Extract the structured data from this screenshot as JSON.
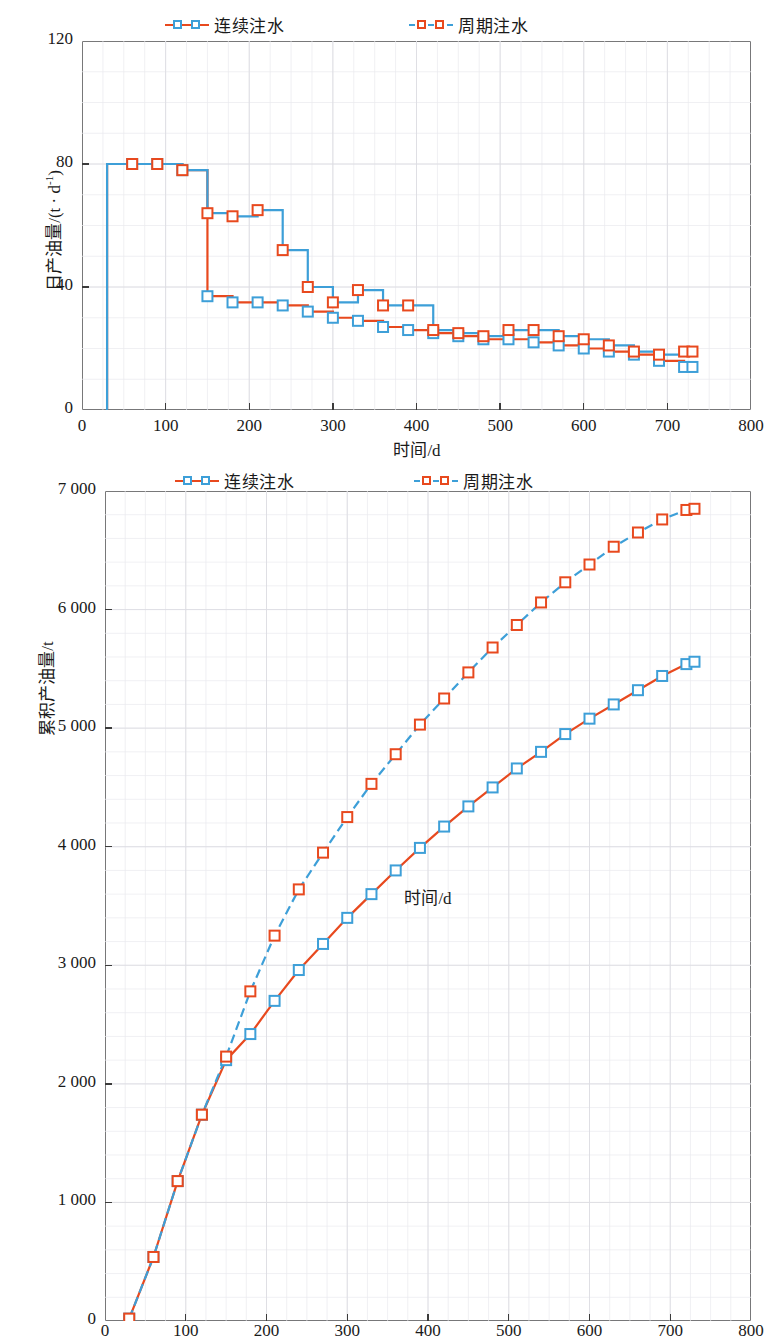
{
  "figure": {
    "legend_series": [
      {
        "key": "continuous",
        "label": "连续注水",
        "marker_color": "#3d9fd8",
        "line_color": "#e8491e",
        "line_style": "solid"
      },
      {
        "key": "cyclic",
        "label": "周期注水",
        "marker_color": "#e8491e",
        "line_color": "#3d9fd8",
        "line_style": "dashed"
      }
    ]
  },
  "chart_data": [
    {
      "id": "daily-oil-production",
      "type": "line",
      "title": "",
      "xlabel": "时间/d",
      "ylabel": "日产油量/(t · d⁻¹)",
      "ylabel_main": "日产油量/(t · d",
      "ylabel_sup": "-1",
      "ylabel_tail": ")",
      "xlim": [
        0,
        800
      ],
      "ylim": [
        0,
        120
      ],
      "xticks": [
        0,
        100,
        200,
        300,
        400,
        500,
        600,
        700,
        800
      ],
      "xtick_labels": [
        "0",
        "100",
        "200",
        "300",
        "400",
        "500",
        "600",
        "700",
        "800"
      ],
      "yticks": [
        0,
        40,
        80,
        120
      ],
      "ytick_labels": [
        "0",
        "40",
        "80",
        "120"
      ],
      "grid": true,
      "step": true,
      "series": [
        {
          "name": "连续注水",
          "marker_color": "#3d9fd8",
          "line_color": "#e8491e",
          "line_style": "solid",
          "x": [
            30,
            60,
            90,
            120,
            150,
            180,
            210,
            240,
            270,
            300,
            330,
            360,
            390,
            420,
            450,
            480,
            510,
            540,
            570,
            600,
            630,
            660,
            690,
            720,
            730
          ],
          "y": [
            80,
            80,
            80,
            78,
            37,
            35,
            35,
            34,
            32,
            30,
            29,
            27,
            26,
            25,
            24,
            23,
            23,
            22,
            21,
            20,
            19,
            18,
            16,
            14,
            14
          ]
        },
        {
          "name": "周期注水",
          "marker_color": "#e8491e",
          "line_color": "#3d9fd8",
          "line_style": "solid",
          "x": [
            30,
            60,
            90,
            120,
            150,
            180,
            210,
            240,
            270,
            300,
            330,
            360,
            390,
            420,
            450,
            480,
            510,
            540,
            570,
            600,
            630,
            660,
            690,
            720,
            730
          ],
          "y": [
            80,
            80,
            80,
            78,
            64,
            63,
            65,
            52,
            40,
            35,
            39,
            34,
            34,
            26,
            25,
            24,
            26,
            26,
            24,
            23,
            21,
            19,
            18,
            19,
            19
          ]
        }
      ]
    },
    {
      "id": "cumulative-oil-production",
      "type": "line",
      "title": "",
      "xlabel": "时间/d",
      "ylabel": "累积产油量/t",
      "xlim": [
        0,
        800
      ],
      "ylim": [
        0,
        7000
      ],
      "xticks": [
        0,
        100,
        200,
        300,
        400,
        500,
        600,
        700,
        800
      ],
      "xtick_labels": [
        "0",
        "100",
        "200",
        "300",
        "400",
        "500",
        "600",
        "700",
        "800"
      ],
      "yticks": [
        0,
        1000,
        2000,
        3000,
        4000,
        5000,
        6000,
        7000
      ],
      "ytick_labels": [
        "0",
        "1 000",
        "2 000",
        "3 000",
        "4 000",
        "5 000",
        "6 000",
        "7 000"
      ],
      "grid": true,
      "step": false,
      "series": [
        {
          "name": "连续注水",
          "marker_color": "#3d9fd8",
          "line_color": "#e8491e",
          "line_style": "solid",
          "x": [
            30,
            60,
            90,
            120,
            150,
            180,
            210,
            240,
            270,
            300,
            330,
            360,
            390,
            420,
            450,
            480,
            510,
            540,
            570,
            600,
            630,
            660,
            690,
            720,
            730
          ],
          "y": [
            20,
            540,
            1180,
            1740,
            2200,
            2420,
            2700,
            2960,
            3180,
            3400,
            3600,
            3800,
            3990,
            4170,
            4340,
            4500,
            4660,
            4800,
            4950,
            5080,
            5200,
            5320,
            5440,
            5540,
            5560
          ]
        },
        {
          "name": "周期注水",
          "marker_color": "#e8491e",
          "line_color": "#3d9fd8",
          "line_style": "dashed",
          "x": [
            30,
            60,
            90,
            120,
            150,
            180,
            210,
            240,
            270,
            300,
            330,
            360,
            390,
            420,
            450,
            480,
            510,
            540,
            570,
            600,
            630,
            660,
            690,
            720,
            730
          ],
          "y": [
            20,
            540,
            1180,
            1740,
            2230,
            2780,
            3250,
            3640,
            3950,
            4250,
            4530,
            4780,
            5030,
            5250,
            5470,
            5680,
            5870,
            6060,
            6230,
            6380,
            6530,
            6650,
            6760,
            6840,
            6850
          ]
        }
      ]
    }
  ]
}
